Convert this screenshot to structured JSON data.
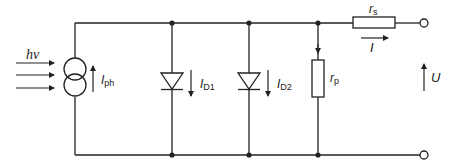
{
  "diagram": {
    "colors": {
      "wire": "#222222",
      "background": "#ffffff"
    },
    "light_source": {
      "label": "hν",
      "arrows": 3
    },
    "current_source": {
      "label_main": "I",
      "label_sub": "ph"
    },
    "diode1": {
      "label_main": "I",
      "label_sub": "D1"
    },
    "diode2": {
      "label_main": "I",
      "label_sub": "D2"
    },
    "parallel_resistor": {
      "label_main": "r",
      "label_sub": "p"
    },
    "series_resistor": {
      "label_main": "r",
      "label_sub": "s"
    },
    "output_current": {
      "label": "I"
    },
    "output_voltage": {
      "label": "U"
    }
  }
}
